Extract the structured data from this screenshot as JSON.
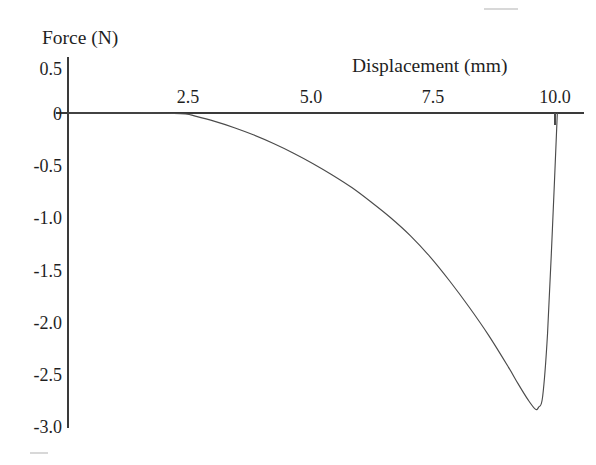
{
  "figure": {
    "background_color": "#ffffff",
    "ink_color": "#3f3f3f"
  },
  "axes": {
    "y_axis": {
      "title": "Force (N)",
      "title_x": 42,
      "title_y": 44,
      "tick_labels": [
        "0.5",
        "0",
        "-0.5",
        "-1.0",
        "-1.5",
        "-2.0",
        "-2.5",
        "-3.0"
      ],
      "tick_values": [
        0.5,
        0,
        -0.5,
        -1.0,
        -1.5,
        -2.0,
        -2.5,
        -3.0
      ],
      "label_right_edge": 62,
      "axis_x": 68,
      "axis_top": 57,
      "axis_bottom": 428
    },
    "x_axis": {
      "title": "Displacement (mm)",
      "title_x": 352,
      "title_y": 72,
      "tick_labels": [
        "2.5",
        "5.0",
        "7.5",
        "10.0"
      ],
      "tick_values": [
        2.5,
        5.0,
        7.5,
        10.0
      ],
      "label_baseline_y": 103,
      "axis_y": 113,
      "axis_left": 56,
      "axis_right": 584,
      "visible_tick_at": 10.0
    }
  },
  "chart_data": {
    "type": "line",
    "title": "",
    "subtitle": "",
    "xlabel": "Displacement (mm)",
    "ylabel": "Force (N)",
    "xlim": [
      0.0,
      10.6
    ],
    "ylim": [
      -3.0,
      0.5
    ],
    "xticks": [
      2.5,
      5.0,
      7.5,
      10.0
    ],
    "yticks": [
      0.5,
      0,
      -0.5,
      -1.0,
      -1.5,
      -2.0,
      -2.5,
      -3.0
    ],
    "grid": false,
    "legend": false,
    "legend_position": "none",
    "annotations": [],
    "series": [
      {
        "name": "Force",
        "x": [
          0.0,
          0.6,
          1.2,
          1.8,
          2.4,
          2.6,
          3.0,
          3.4,
          3.8,
          4.2,
          4.6,
          5.0,
          5.4,
          5.8,
          6.2,
          6.6,
          7.0,
          7.4,
          7.8,
          8.2,
          8.6,
          9.0,
          9.2,
          9.4,
          9.55,
          9.62,
          9.7,
          9.8,
          9.9,
          10.0
        ],
        "y": [
          0.0,
          0.0,
          0.0,
          0.0,
          -0.01,
          -0.03,
          -0.08,
          -0.14,
          -0.21,
          -0.29,
          -0.38,
          -0.48,
          -0.59,
          -0.71,
          -0.85,
          -1.0,
          -1.17,
          -1.37,
          -1.6,
          -1.85,
          -2.12,
          -2.42,
          -2.58,
          -2.73,
          -2.82,
          -2.8,
          -2.7,
          -2.1,
          -1.1,
          0.0
        ]
      }
    ],
    "notable_points": {
      "departure_from_zero": {
        "x": 2.6,
        "y": 0.0
      },
      "minimum": {
        "x": 9.6,
        "y": -2.82
      },
      "return_to_zero": {
        "x": 10.0,
        "y": 0.0
      }
    }
  }
}
